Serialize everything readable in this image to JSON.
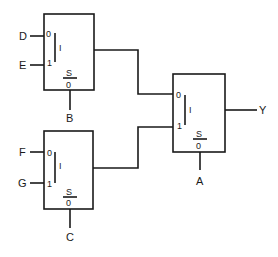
{
  "diagram": {
    "type": "mux-tree",
    "stroke_color": "#1a1a1a",
    "background": "#ffffff",
    "muxes": [
      {
        "id": "mux-top",
        "inputs": [
          {
            "port": "0",
            "signal": "D"
          },
          {
            "port": "1",
            "signal": "E"
          }
        ],
        "select_label": "S",
        "select_sub": "0",
        "select_signal": "B",
        "bar_glyph": "I"
      },
      {
        "id": "mux-bottom",
        "inputs": [
          {
            "port": "0",
            "signal": "F"
          },
          {
            "port": "1",
            "signal": "G"
          }
        ],
        "select_label": "S",
        "select_sub": "0",
        "select_signal": "C",
        "bar_glyph": "I"
      },
      {
        "id": "mux-output",
        "inputs": [
          {
            "port": "0",
            "signal": "mux-top.out"
          },
          {
            "port": "1",
            "signal": "mux-bottom.out"
          }
        ],
        "select_label": "S",
        "select_sub": "0",
        "select_signal": "A",
        "bar_glyph": "I",
        "output_signal": "Y"
      }
    ]
  }
}
